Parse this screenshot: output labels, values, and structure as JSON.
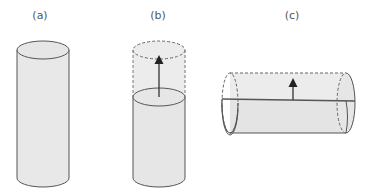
{
  "figure": {
    "panels": [
      {
        "id": "a",
        "label": "(a)",
        "description": "upright solid cylinder"
      },
      {
        "id": "b",
        "label": "(b)",
        "description": "upright cylinder with liquid level and dashed upper extent, arrow pointing up"
      },
      {
        "id": "c",
        "label": "(c)",
        "description": "horizontal cylinder with dashed ends, horizontal level line, arrow pointing up"
      }
    ]
  },
  "colors": {
    "fill": "#e8e8e8",
    "stroke": "#555555",
    "text": "#555555",
    "arrow": "#222222"
  }
}
